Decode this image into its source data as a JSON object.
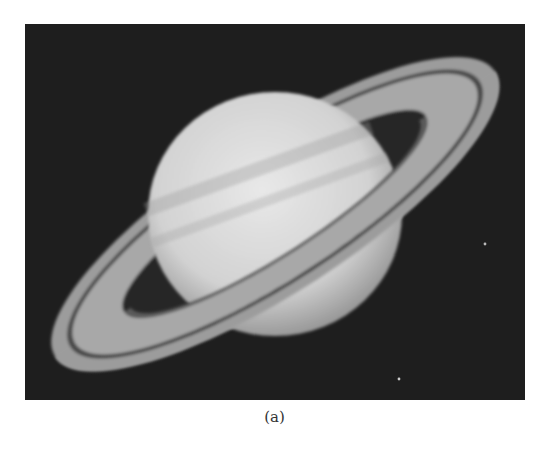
{
  "figure": {
    "image_alt": "Saturn with its rings, grayscale photograph",
    "caption": "(a)"
  },
  "colors": {
    "background": "#ffffff",
    "space": "#1e1e1e",
    "planet_light": "#e6e6e6",
    "planet_shade": "#b4b4b4",
    "ring": "#a8a8a8",
    "ring_gap": "#4a4a4a"
  }
}
